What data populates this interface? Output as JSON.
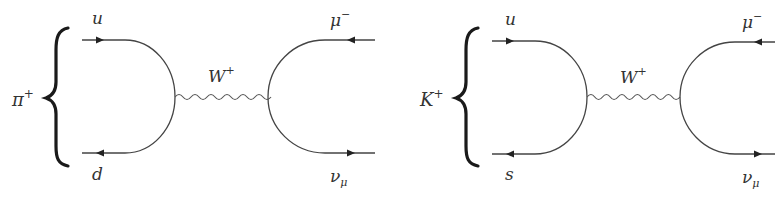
{
  "diagrams": [
    {
      "meson": {
        "base": "π",
        "charge": "+"
      },
      "quark_top": "u",
      "quark_bottom": "d",
      "boson": {
        "base": "W",
        "charge": "+"
      },
      "lepton_top": {
        "base": "μ",
        "charge": "−"
      },
      "lepton_bottom": {
        "base": "ν",
        "sub": "μ"
      }
    },
    {
      "meson": {
        "base": "K",
        "charge": "+"
      },
      "quark_top": "u",
      "quark_bottom": "s",
      "boson": {
        "base": "W",
        "charge": "+"
      },
      "lepton_top": {
        "base": "μ",
        "charge": "−"
      },
      "lepton_bottom": {
        "base": "ν",
        "sub": "μ"
      }
    }
  ],
  "colors": {
    "line": "#444444",
    "brace": "#1a1a1a",
    "text": "#333333"
  }
}
